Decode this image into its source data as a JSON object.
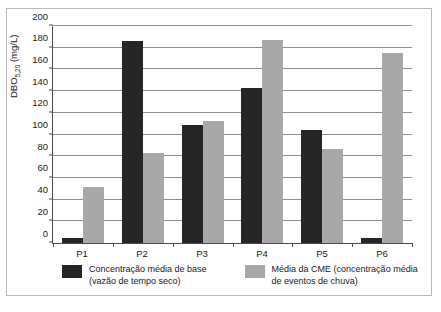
{
  "chart_data": {
    "type": "bar",
    "title": "",
    "xlabel": "",
    "ylabel": "DBO5,20 (mg/L)",
    "ylabel_main": "DBO",
    "ylabel_sub": "5,20",
    "ylabel_unit": " (mg/L)",
    "categories": [
      "P1",
      "P2",
      "P3",
      "P4",
      "P5",
      "P6"
    ],
    "ylim": [
      0,
      200
    ],
    "yticks": [
      0,
      20,
      40,
      60,
      80,
      100,
      120,
      140,
      160,
      180,
      200
    ],
    "grid": "horizontal",
    "legend_position": "bottom",
    "series": [
      {
        "name": "Concentração média de base (vazão de tempo seco)",
        "name_line1": "Concentração média de base",
        "name_line2": "(vazão de tempo seco)",
        "color": "#262626",
        "values": [
          5,
          185,
          108,
          142,
          104,
          5
        ]
      },
      {
        "name": "Média da CME (concentração média de eventos de chuva)",
        "name_line1": "Média da CME (concentração média",
        "name_line2": "de eventos de chuva)",
        "color": "#a8a8a8",
        "values": [
          51,
          83,
          112,
          186,
          86,
          174
        ]
      }
    ]
  },
  "colors": {
    "series_base": "#262626",
    "series_cme": "#a8a8a8",
    "axis": "#4a4a4a",
    "gridline": "#8e8e8e",
    "frame": "#b9b9b9",
    "background": "#ffffff"
  }
}
